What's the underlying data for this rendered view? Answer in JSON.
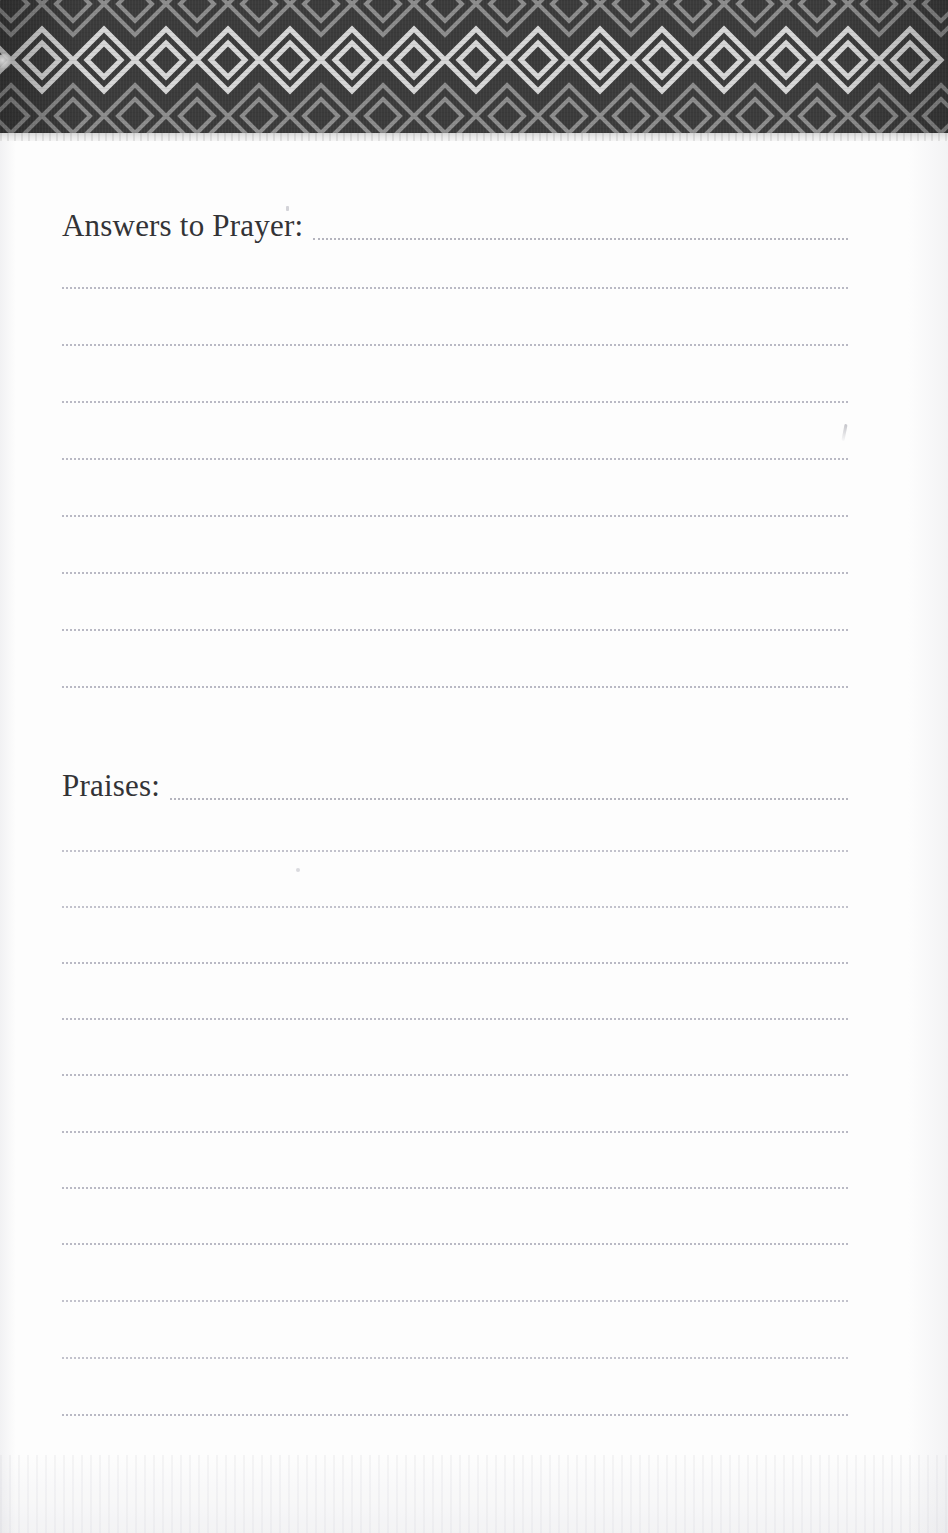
{
  "page": {
    "background_color": "#fdfdfd",
    "width": 948,
    "height": 1533
  },
  "header": {
    "name": "decorative-diamond-border",
    "band_color": "#3b3b3b",
    "motif_color": "#d5d5d5",
    "motif": "diamond-lattice",
    "band_top": 0,
    "band_height": 133,
    "diamond_pitch": 62,
    "diamond_count": 16,
    "underline_color": "#e3e3e3"
  },
  "sections": [
    {
      "id": "answers-to-prayer",
      "heading": "Answers to Prayer:",
      "heading_top": 210,
      "heading_font_size": 31,
      "rule_color": "#b9b9c4",
      "line_left": 62,
      "line_right": 848,
      "line_count": 8,
      "line_positions": [
        285,
        342,
        399,
        456,
        513,
        570,
        627,
        684
      ]
    },
    {
      "id": "praises",
      "heading": "Praises:",
      "heading_top": 770,
      "heading_font_size": 31,
      "rule_color": "#b9b9c4",
      "line_left": 62,
      "line_right": 848,
      "line_count": 11,
      "line_positions": [
        848,
        904,
        960,
        1016,
        1072,
        1129,
        1185,
        1241,
        1298,
        1355,
        1412
      ]
    }
  ],
  "artifacts": {
    "edge_blob": "scan-edge-blob",
    "slash_mark": "scan-slash-mark",
    "tick_mark_top": "scan-tick-mark",
    "tick_mark_lower": "scan-speck"
  }
}
